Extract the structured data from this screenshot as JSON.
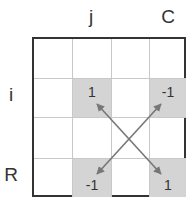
{
  "column_labels": [
    {
      "col": 1,
      "text": "j"
    },
    {
      "col": 3,
      "text": "C"
    }
  ],
  "row_labels": [
    {
      "row": 1,
      "text": "i"
    },
    {
      "row": 3,
      "text": "R"
    }
  ],
  "grid": {
    "rows": 4,
    "cols": 4
  },
  "cells": [
    {
      "row": 1,
      "col": 1,
      "value": "1",
      "shaded": true,
      "valign": "top"
    },
    {
      "row": 1,
      "col": 3,
      "value": "-1",
      "shaded": true,
      "valign": "top"
    },
    {
      "row": 3,
      "col": 1,
      "value": "-1",
      "shaded": true,
      "valign": "bottom"
    },
    {
      "row": 3,
      "col": 3,
      "value": "1",
      "shaded": true,
      "valign": "bottom"
    }
  ],
  "arrows": [
    {
      "from": "cell(3,3)",
      "to": "cell(1,1)",
      "bidirectional": true
    },
    {
      "from": "cell(3,1)",
      "to": "cell(1,3)",
      "bidirectional": true
    }
  ],
  "colors": {
    "shaded": "#d4d4d4",
    "arrow": "#777777",
    "border": "#333333",
    "gridline": "#c8c8c8"
  }
}
